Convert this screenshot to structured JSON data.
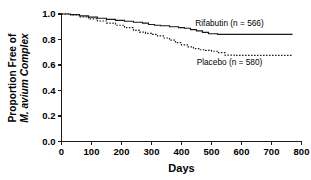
{
  "chart_data": {
    "type": "line",
    "title": "",
    "subtitle": "",
    "xlabel": "Days",
    "ylabel_line1": "Proportion Free of",
    "ylabel_line2": "M. avium Complex",
    "xlim": [
      0,
      800
    ],
    "ylim": [
      0.0,
      1.0
    ],
    "xticks": [
      0,
      100,
      200,
      300,
      400,
      500,
      600,
      700,
      800
    ],
    "xtick_labels": [
      "0",
      "100",
      "200",
      "300",
      "400",
      "500",
      "600",
      "700",
      "800"
    ],
    "yticks": [
      0.0,
      0.2,
      0.4,
      0.6,
      0.8,
      1.0
    ],
    "ytick_labels": [
      "0.0",
      "0.2",
      "0.4",
      "0.6",
      "0.8",
      "1.0"
    ],
    "grid": false,
    "legend_position": "inline-annotation",
    "series": [
      {
        "name": "Rifabutin",
        "label": "Rifabutin (n = 566)",
        "n": 566,
        "style": "solid",
        "color": "#1a1a1a",
        "label_x": 560,
        "label_y": 0.905,
        "x": [
          0,
          30,
          60,
          90,
          120,
          150,
          180,
          210,
          240,
          270,
          290,
          310,
          330,
          360,
          390,
          410,
          430,
          450,
          470,
          490,
          520,
          560,
          600,
          650,
          700,
          770
        ],
        "y": [
          1.0,
          0.995,
          0.985,
          0.975,
          0.967,
          0.958,
          0.95,
          0.943,
          0.935,
          0.928,
          0.918,
          0.912,
          0.908,
          0.9,
          0.893,
          0.888,
          0.878,
          0.868,
          0.856,
          0.845,
          0.84,
          0.84,
          0.84,
          0.84,
          0.84,
          0.84
        ]
      },
      {
        "name": "Placebo",
        "label": "Placebo (n = 580)",
        "n": 580,
        "style": "dotted",
        "color": "#1a1a1a",
        "label_x": 560,
        "label_y": 0.6,
        "x": [
          0,
          30,
          60,
          90,
          120,
          150,
          180,
          210,
          240,
          260,
          280,
          300,
          320,
          340,
          360,
          380,
          400,
          420,
          440,
          460,
          480,
          500,
          520,
          545,
          580,
          620,
          670,
          720,
          770
        ],
        "y": [
          1.0,
          0.992,
          0.978,
          0.962,
          0.945,
          0.928,
          0.912,
          0.893,
          0.872,
          0.858,
          0.848,
          0.84,
          0.828,
          0.812,
          0.795,
          0.775,
          0.758,
          0.742,
          0.728,
          0.72,
          0.715,
          0.708,
          0.697,
          0.678,
          0.675,
          0.675,
          0.675,
          0.675,
          0.675
        ]
      }
    ]
  },
  "axis": {
    "line_color": "#1a1a1a"
  }
}
